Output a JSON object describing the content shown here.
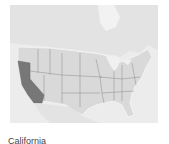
{
  "map": {
    "region": "United States",
    "highlighted_state": "California",
    "colors": {
      "water": "#ececec",
      "land": "#d9d9d9",
      "canada": "#e3e3e3",
      "highlight": "#777777",
      "border": "#8a8a8a"
    }
  },
  "caption": {
    "text": "California"
  }
}
